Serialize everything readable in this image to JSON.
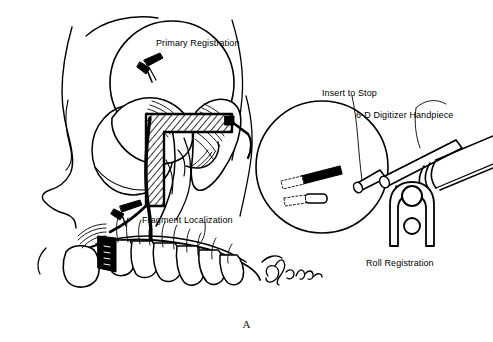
{
  "figure": {
    "caption": "A",
    "background_color": "#ffffff",
    "ink_color": "#000000",
    "width": 493,
    "height": 342
  },
  "labels": {
    "primary_registration": "Primary Registration",
    "fragment_localization": "Fragment Localization",
    "insert_to_stop": "Insert to Stop",
    "digitizer_handpiece": "6-D Digitizer Handpiece",
    "roll_registration": "Roll Registration"
  },
  "illustration": {
    "title": "Craniofacial fracture registration with 6-D digitizer",
    "left_panel": {
      "name": "lateral-skull-view",
      "description": "Line drawing of lateral skull, orbit, zygoma, maxilla and dentition with fracture lines and bone plate",
      "callout_circles": [
        {
          "name": "primary-registration-circle",
          "cx": 172,
          "cy": 83,
          "r": 62
        },
        {
          "name": "orbit-circle",
          "cx": 132,
          "cy": 148,
          "r": 42
        }
      ],
      "signature": "A. Luce"
    },
    "right_panel": {
      "name": "digitizer-detail-view",
      "description": "Magnified circular inset showing 6-D digitizer handpiece inserted into a registration socket",
      "callout_circles": [
        {
          "name": "digitizer-detail-circle",
          "cx": 322,
          "cy": 167,
          "r": 66
        }
      ],
      "roll_registration_icon": {
        "name": "roll-registration-fork",
        "description": "Fork / yoke shape with upper ring and lower ball"
      }
    }
  }
}
